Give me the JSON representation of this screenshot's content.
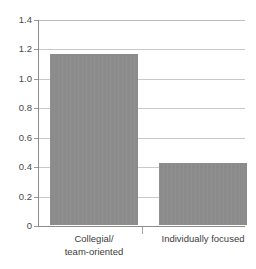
{
  "chart_data": {
    "type": "bar",
    "title": "",
    "subtitle": "",
    "xlabel": "",
    "ylabel": "",
    "categories": [
      "Collegial/\nteam-oriented",
      "Individually focused"
    ],
    "category_lines": [
      [
        "Collegial/",
        "team-oriented"
      ],
      [
        "Individually focused"
      ]
    ],
    "values": [
      1.16,
      0.42
    ],
    "ylim": [
      0,
      1.4
    ],
    "yticks": [
      0,
      0.2,
      0.4,
      0.6,
      0.8,
      1.0,
      1.2,
      1.4
    ],
    "ytick_labels": [
      "0",
      "0.2",
      "0.4",
      "0.6",
      "0.8",
      "1.0",
      "1.2",
      "1.4"
    ],
    "grid": "horizontal",
    "legend": "none",
    "bar_color": "#8b8b8b",
    "gridline_color": "#c9c9c9",
    "axis_color": "#8d8d8d",
    "text_color": "#3d3d3d",
    "background": "#ffffff"
  }
}
